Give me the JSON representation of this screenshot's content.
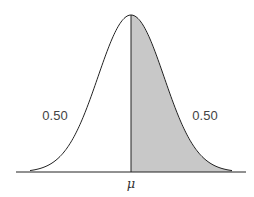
{
  "diagram": {
    "type": "normal-distribution-curve",
    "left_area_label": "0.50",
    "right_area_label": "0.50",
    "mean_label": "μ",
    "shaded_region": "right-half",
    "colors": {
      "curve": "#222222",
      "fill": "#c8c8c8",
      "axis": "#222222",
      "text": "#444444"
    }
  }
}
